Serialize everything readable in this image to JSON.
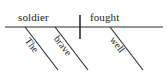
{
  "diagram": {
    "type": "sentence-diagram",
    "style": "reed-kellogg",
    "sentence": "The brave soldier fought well",
    "background_color": "#ffffff",
    "line_color": "#2b2b2b",
    "text_color": "#1a1a1a",
    "baseline": {
      "subject": "soldier",
      "verb": "fought",
      "divider": "vertical-bar"
    },
    "modifiers": [
      {
        "word": "The",
        "modifies": "soldier"
      },
      {
        "word": "brave",
        "modifies": "soldier"
      },
      {
        "word": "well",
        "modifies": "fought"
      }
    ]
  }
}
